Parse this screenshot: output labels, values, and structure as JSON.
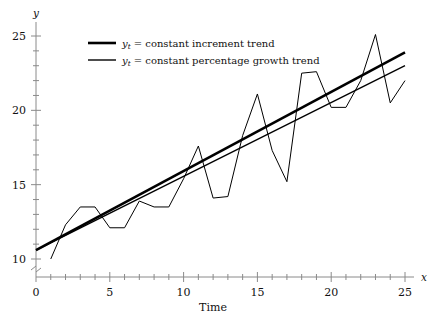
{
  "chart_data": {
    "type": "line",
    "title": "",
    "xlabel": "Time",
    "ylabel": "",
    "x_axis_name": "x",
    "y_axis_name": "y",
    "xlim": [
      0,
      26
    ],
    "ylim": [
      9.2,
      25.8
    ],
    "y_axis_break": true,
    "grid": false,
    "legend_position": "top-left",
    "x_ticks_major": [
      0,
      5,
      10,
      15,
      20,
      25
    ],
    "x_ticks_minor": [
      1,
      2,
      3,
      4,
      6,
      7,
      8,
      9,
      11,
      12,
      13,
      14,
      16,
      17,
      18,
      19,
      21,
      22,
      23,
      24
    ],
    "y_ticks_major": [
      10,
      15,
      20,
      25
    ],
    "y_ticks_minor": [
      11,
      12,
      13,
      14,
      16,
      17,
      18,
      19,
      21,
      22,
      23,
      24
    ],
    "x": [
      1,
      2,
      3,
      4,
      5,
      6,
      7,
      8,
      9,
      10,
      11,
      12,
      13,
      14,
      15,
      16,
      17,
      18,
      19,
      20,
      21,
      22,
      23,
      24,
      25
    ],
    "series": [
      {
        "name": "observed",
        "label": "",
        "in_legend": false,
        "line_width": 1,
        "values": [
          10.0,
          12.3,
          13.5,
          13.5,
          12.1,
          12.1,
          13.9,
          13.5,
          13.5,
          15.4,
          17.6,
          14.1,
          14.2,
          18.3,
          21.1,
          17.3,
          15.2,
          22.5,
          22.6,
          20.2,
          20.2,
          22.0,
          25.1,
          20.5,
          22.0
        ]
      },
      {
        "name": "constant_increment_trend",
        "label": "constant increment trend",
        "in_legend": true,
        "line_width": 2.6,
        "y_at_x0": 10.6,
        "y_at_x25": 23.9,
        "values": [
          11.13,
          11.66,
          12.19,
          12.72,
          13.26,
          13.79,
          14.32,
          14.85,
          15.38,
          15.92,
          16.45,
          16.98,
          17.51,
          18.04,
          18.58,
          19.11,
          19.64,
          20.17,
          20.7,
          21.24,
          21.77,
          22.3,
          22.83,
          23.36,
          23.9
        ]
      },
      {
        "name": "constant_percentage_growth_trend",
        "label": "constant percentage growth trend",
        "in_legend": true,
        "line_width": 1.4,
        "y_at_x0": 10.6,
        "y_at_x25": 23.0,
        "values": [
          11.01,
          11.43,
          11.86,
          12.31,
          12.78,
          13.27,
          13.78,
          14.3,
          14.85,
          15.41,
          16.0,
          16.61,
          17.24,
          17.9,
          18.58,
          19.29,
          20.02,
          20.79,
          21.58,
          22.4,
          23.0,
          23.0,
          23.0,
          23.0,
          23.0
        ]
      }
    ],
    "legend": [
      {
        "variable": "y",
        "subscript": "t",
        "equals": "=",
        "text": "constant increment trend"
      },
      {
        "variable": "y",
        "subscript": "t",
        "equals": "=",
        "text": "constant percentage growth trend"
      }
    ],
    "colors": {
      "line": "#000000",
      "axis": "#8a8a8a",
      "text": "#111111",
      "background": "#ffffff"
    }
  }
}
